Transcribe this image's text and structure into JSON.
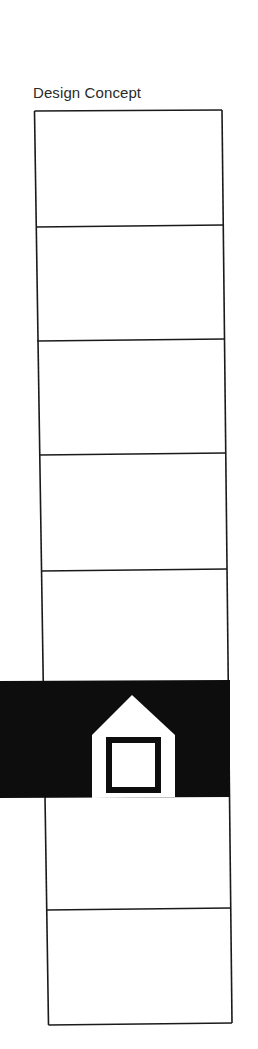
{
  "diagram": {
    "title": "Design Concept",
    "column": {
      "segments": 8,
      "divider_y": [
        111,
        226,
        339,
        455,
        570,
        682,
        797,
        910,
        1025
      ],
      "highlighted_segment_index": 5
    },
    "band": {
      "color": "#0d0d0d",
      "icon": "house-icon",
      "icon_fill": "#ffffff"
    },
    "line_color": "#1a1a1a"
  }
}
